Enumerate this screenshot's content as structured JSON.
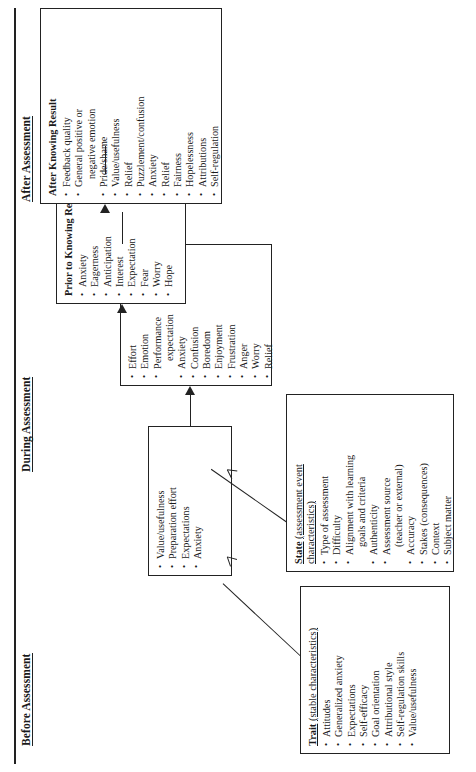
{
  "figure": {
    "orientation": "sideways (rotated 90 degrees counter-clockwise on the page)"
  },
  "phases": [
    {
      "id": "before",
      "label": "Before Assessment"
    },
    {
      "id": "during",
      "label": "During Assessment"
    },
    {
      "id": "after",
      "label": "After Assessment"
    }
  ],
  "boxes": {
    "trait": {
      "title_bold": "Trait",
      "title_rest": "(stable characteristics)",
      "items": [
        "Attitudes",
        "Generalized anxiety",
        "Expectations",
        "Self-efficacy",
        "Goal orientation",
        "Attributional style",
        "Self-regulation skills",
        "Value/usefulness"
      ]
    },
    "state": {
      "title_bold": "State",
      "title_rest": "(assessment event characteristics)",
      "items": [
        "Type of assessment",
        "Difficulty",
        "Alignment with learning",
        "Authenticity",
        "Assessment source",
        "Accuracy",
        "Stakes (consequences)",
        "Context",
        "Subject matter"
      ],
      "item_continuations": {
        "Alignment with learning": "goals and criteria",
        "Assessment source": "(teacher or external)"
      }
    },
    "before": {
      "title_bold": "",
      "title_rest": "",
      "items": [
        "Value/usefulness",
        "Preparation effort",
        "Expectations",
        "Anxiety"
      ]
    },
    "during": {
      "title_bold": "",
      "title_rest": "",
      "items": [
        "Effort",
        "Emotion",
        "Performance",
        "Anxiety",
        "Confusion",
        "Boredom",
        "Enjoyment",
        "Frustration",
        "Anger",
        "Worry",
        "Relief"
      ],
      "item_continuations": {
        "Performance": "expectation"
      }
    },
    "prior": {
      "title_bold": "Prior to Knowing Result",
      "title_rest": "",
      "items": [
        "Anxiety",
        "Eagerness",
        "Anticipation",
        "Interest",
        "Expectation",
        "Fear",
        "Worry",
        "Hope"
      ]
    },
    "after": {
      "title_bold": "After Knowing Result",
      "title_rest": "",
      "items": [
        "Feedback quality",
        "General positive or",
        "Pride/shame",
        "Value/usefulness",
        "Relief",
        "Puzzlement/confusion",
        "Anxiety",
        "Relief",
        "Fairness",
        "Hopelessness",
        "Attributions",
        "Self-regulation"
      ],
      "item_continuations": {
        "General positive or": "negative emotion"
      }
    }
  },
  "colors": {
    "ink": "#1a1a1a",
    "line": "#222222",
    "paper": "#ffffff"
  }
}
